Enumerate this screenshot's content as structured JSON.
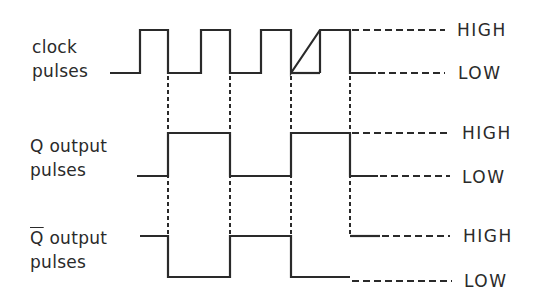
{
  "diagram": {
    "type": "timing-diagram",
    "signals": [
      {
        "label_line1": "clock",
        "label_line2": "pulses",
        "high_label": "HIGH",
        "low_label": "LOW"
      },
      {
        "label_line1_prefix": "Q",
        "label_line1": " output",
        "label_line2": "pulses",
        "high_label": "HIGH",
        "low_label": "LOW"
      },
      {
        "label_line1_prefix": "Q",
        "label_line1_prefix_overbar": true,
        "label_line1": " output",
        "label_line2": "pulses",
        "high_label": "HIGH",
        "low_label": "LOW"
      }
    ],
    "clock_edges": {
      "rising_x": [
        140,
        201,
        261,
        320
      ],
      "falling_x": [
        168,
        230,
        291,
        350
      ]
    },
    "q_transitions": "toggles on each clock falling edge",
    "colors": {
      "line": "#2a2a2a",
      "background": "#ffffff"
    }
  }
}
